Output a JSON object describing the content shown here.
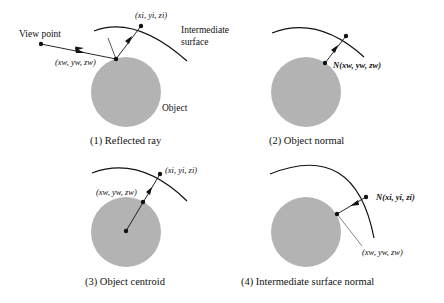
{
  "figure": {
    "panels": [
      {
        "caption": "(1) Reflected ray",
        "labels": {
          "view_point": "View point",
          "hit_point": "(xw, yw, zw)",
          "surface_point": "(xi, yi, zi)",
          "surface": [
            "Intermediate",
            "surface"
          ],
          "object": "Object"
        }
      },
      {
        "caption": "(2) Object normal",
        "labels": {
          "normal": "N(xw, yw, zw)"
        }
      },
      {
        "caption": "(3) Object centroid",
        "labels": {
          "surface_point": "(xi, yi, zi)",
          "hit_point": "(xw, yw, zw)"
        }
      },
      {
        "caption": "(4) Intermediate surface normal",
        "labels": {
          "normal": "N(xi, yi, zi)",
          "hit_point": "(xw, yw, zw)"
        }
      }
    ],
    "colors": {
      "object_fill": "#b3b3b3",
      "stroke": "#111111",
      "background": "#ffffff"
    }
  }
}
